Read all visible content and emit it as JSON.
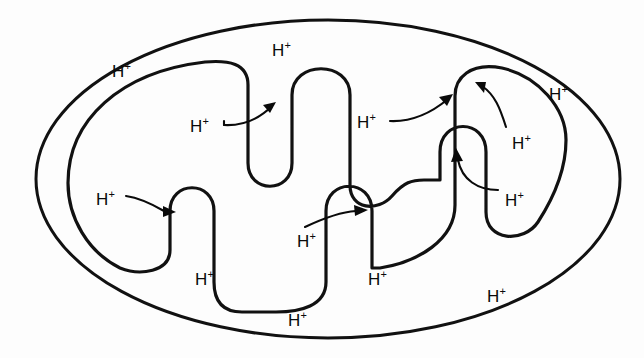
{
  "figure": {
    "background_color": "#fdfdfd",
    "stroke_color": "#111111",
    "width": 644,
    "height": 358
  },
  "species_label": "H",
  "species_charge": "+",
  "membranes": [
    {
      "name": "outer-membrane",
      "shape": "ellipse"
    },
    {
      "name": "inner-membrane",
      "shape": "folded-cristae"
    }
  ],
  "proton_labels": [
    {
      "id": "h-top-center",
      "text": "H",
      "charge": "+",
      "x": 272,
      "y": 42,
      "region": "intermembrane-space"
    },
    {
      "id": "h-top-left",
      "text": "H",
      "charge": "+",
      "x": 112,
      "y": 63,
      "region": "intermembrane-space"
    },
    {
      "id": "h-top-right",
      "text": "H",
      "charge": "+",
      "x": 549,
      "y": 86,
      "region": "intermembrane-space"
    },
    {
      "id": "h-left-upper-source",
      "text": "H",
      "charge": "+",
      "x": 190,
      "y": 118,
      "region": "matrix"
    },
    {
      "id": "h-mid-source",
      "text": "H",
      "charge": "+",
      "x": 357,
      "y": 114,
      "region": "matrix"
    },
    {
      "id": "h-right-upper",
      "text": "H",
      "charge": "+",
      "x": 512,
      "y": 135,
      "region": "matrix"
    },
    {
      "id": "h-left-lower-source",
      "text": "H",
      "charge": "+",
      "x": 96,
      "y": 191,
      "region": "matrix"
    },
    {
      "id": "h-right-lower",
      "text": "H",
      "charge": "+",
      "x": 505,
      "y": 192,
      "region": "matrix"
    },
    {
      "id": "h-bottom-source",
      "text": "H",
      "charge": "+",
      "x": 297,
      "y": 233,
      "region": "matrix"
    },
    {
      "id": "h-crista-left",
      "text": "H",
      "charge": "+",
      "x": 195,
      "y": 271,
      "region": "crista-lumen"
    },
    {
      "id": "h-crista-right",
      "text": "H",
      "charge": "+",
      "x": 368,
      "y": 271,
      "region": "crista-lumen"
    },
    {
      "id": "h-bottom-center",
      "text": "H",
      "charge": "+",
      "x": 288,
      "y": 312,
      "region": "intermembrane-space"
    },
    {
      "id": "h-bottom-right",
      "text": "H",
      "charge": "+",
      "x": 487,
      "y": 288,
      "region": "intermembrane-space"
    }
  ],
  "arrows": [
    {
      "id": "arrow-left-upper",
      "from": "h-left-upper-source",
      "direction": "up-right",
      "description": "proton pumped into upper-left crista"
    },
    {
      "id": "arrow-mid-upper",
      "from": "h-mid-source",
      "direction": "up-right",
      "description": "proton pumped into central crista"
    },
    {
      "id": "arrow-right-upper",
      "from": "h-right-upper",
      "direction": "up-left",
      "description": "proton pumped into narrow right crista top"
    },
    {
      "id": "arrow-right-lower",
      "from": "h-right-lower",
      "direction": "up",
      "description": "proton pumped up into narrow right crista"
    },
    {
      "id": "arrow-left-lower",
      "from": "h-left-lower-source",
      "direction": "right",
      "description": "proton pumped into lower-left crista"
    },
    {
      "id": "arrow-bottom-mid",
      "from": "h-bottom-source",
      "direction": "up-right",
      "description": "proton pumped into lower-central crista"
    }
  ]
}
